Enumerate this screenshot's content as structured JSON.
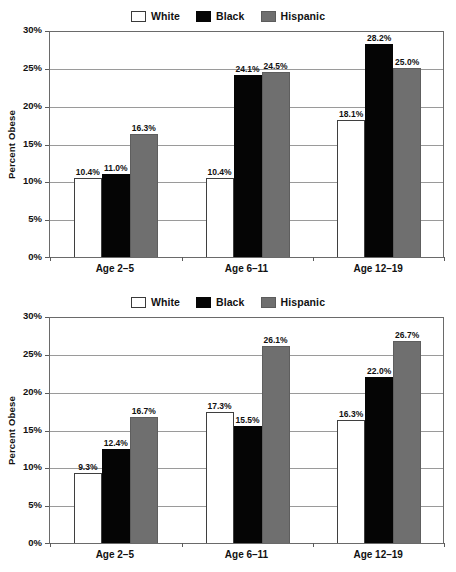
{
  "chart_data": [
    {
      "type": "bar",
      "title": "",
      "xlabel": "",
      "ylabel": "Percent Obese",
      "categories": [
        "Age 2–5",
        "Age 6–11",
        "Age 12–19"
      ],
      "ylim": [
        0,
        30
      ],
      "ytick_labels": [
        "0%",
        "5%",
        "10%",
        "15%",
        "20%",
        "25%",
        "30%"
      ],
      "ytick_values": [
        0,
        5,
        10,
        15,
        20,
        25,
        30
      ],
      "grid": true,
      "legend_position": "top-center",
      "series": [
        {
          "name": "White",
          "color": "#ffffff",
          "values": [
            10.4,
            10.4,
            18.1
          ],
          "labels": [
            "10.4%",
            "10.4%",
            "18.1%"
          ]
        },
        {
          "name": "Black",
          "color": "#050505",
          "values": [
            11.0,
            24.1,
            28.2
          ],
          "labels": [
            "11.0%",
            "24.1%",
            "28.2%"
          ]
        },
        {
          "name": "Hispanic",
          "color": "#6f6f6f",
          "values": [
            16.3,
            24.5,
            25.0
          ],
          "labels": [
            "16.3%",
            "24.5%",
            "25.0%"
          ]
        }
      ]
    },
    {
      "type": "bar",
      "title": "",
      "xlabel": "",
      "ylabel": "Percent Obese",
      "categories": [
        "Age 2–5",
        "Age 6–11",
        "Age 12–19"
      ],
      "ylim": [
        0,
        30
      ],
      "ytick_labels": [
        "0%",
        "5%",
        "10%",
        "15%",
        "20%",
        "25%",
        "30%"
      ],
      "ytick_values": [
        0,
        5,
        10,
        15,
        20,
        25,
        30
      ],
      "grid": true,
      "legend_position": "top-center",
      "series": [
        {
          "name": "White",
          "color": "#ffffff",
          "values": [
            9.3,
            17.3,
            16.3
          ],
          "labels": [
            "9.3%",
            "17.3%",
            "16.3%"
          ]
        },
        {
          "name": "Black",
          "color": "#050505",
          "values": [
            12.4,
            15.5,
            22.0
          ],
          "labels": [
            "12.4%",
            "15.5%",
            "22.0%"
          ]
        },
        {
          "name": "Hispanic",
          "color": "#6f6f6f",
          "values": [
            16.7,
            26.1,
            26.7
          ],
          "labels": [
            "16.7%",
            "26.1%",
            "26.7%"
          ]
        }
      ]
    }
  ],
  "colors": {
    "white_series": "#ffffff",
    "black_series": "#050505",
    "hispanic_series": "#6f6f6f",
    "axis": "#6a6a6a",
    "grid": "#9a9a9a",
    "text": "#111111"
  }
}
